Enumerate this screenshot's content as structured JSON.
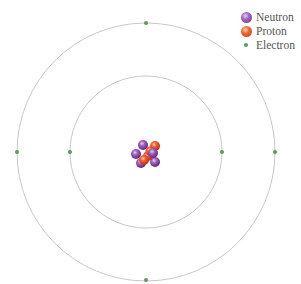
{
  "legend": {
    "items": [
      {
        "label": "Neutron",
        "color": "#7b3fa0"
      },
      {
        "label": "Proton",
        "color": "#e8502a"
      },
      {
        "label": "Electron",
        "color": "#5a9a5a"
      }
    ]
  },
  "atom": {
    "center": [
      146,
      152
    ],
    "orbits": [
      {
        "name": "inner-shell",
        "radius": 76,
        "electrons": 2
      },
      {
        "name": "outer-shell",
        "radius": 129,
        "electrons": 4
      }
    ],
    "nucleus": {
      "neutrons": 5,
      "protons": 4
    },
    "orbit_color": "#c8c8cc",
    "electron_color": "#5a9a5a"
  }
}
